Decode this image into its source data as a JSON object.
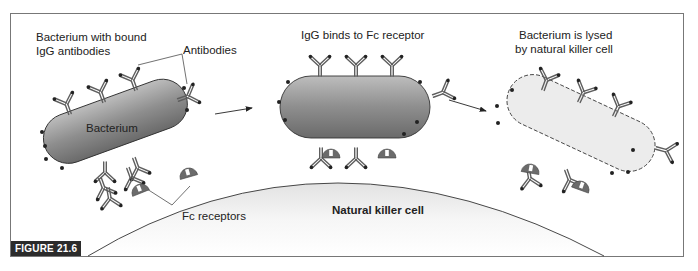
{
  "figure": {
    "label": "FIGURE 21.6",
    "frame_color": "#777777"
  },
  "panels": [
    {
      "title_line1": "Bacterium with bound",
      "title_line2": "IgG antibodies",
      "bacterium_label": "Bacterium",
      "callout_antibodies": "Antibodies",
      "callout_receptors": "Fc receptors"
    },
    {
      "title_line1": "IgG binds to Fc receptor"
    },
    {
      "title_line1": "Bacterium is lysed",
      "title_line2": "by natural killer cell"
    }
  ],
  "nk_cell_label": "Natural killer cell",
  "colors": {
    "bacterium_fill_light": "#c8c8c8",
    "bacterium_fill_dark": "#6e6e6e",
    "lysed_fill": "#ededed",
    "antibody": "#6a6a6a",
    "receptor": "#666666",
    "cell_fill": "#f2f2f2",
    "outline": "#333333"
  }
}
